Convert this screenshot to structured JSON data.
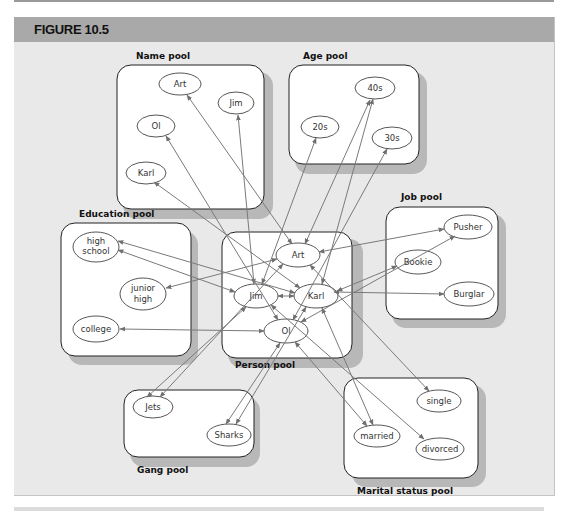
{
  "figure": {
    "title": "FIGURE 10.5",
    "colors": {
      "header": "#a9a9a9",
      "panel": "#e9e9e9",
      "pool_fill": "#ffffff",
      "pool_shadow": "#b9b9b9",
      "arrow": "#7a7a7a"
    }
  },
  "pools": {
    "name": {
      "label": "Name pool",
      "nodes": [
        "Art",
        "Jim",
        "Ol",
        "Karl"
      ]
    },
    "age": {
      "label": "Age pool",
      "nodes": [
        "40s",
        "20s",
        "30s"
      ]
    },
    "education": {
      "label": "Education pool",
      "nodes": [
        "high school",
        "junior high",
        "college"
      ]
    },
    "person": {
      "label": "Person pool",
      "nodes": [
        "Art",
        "Jim",
        "Karl",
        "Ol"
      ]
    },
    "job": {
      "label": "Job pool",
      "nodes": [
        "Pusher",
        "Bookie",
        "Burglar"
      ]
    },
    "gang": {
      "label": "Gang pool",
      "nodes": [
        "Jets",
        "Sharks"
      ]
    },
    "marital": {
      "label": "Marital status pool",
      "nodes": [
        "single",
        "married",
        "divorced"
      ]
    }
  },
  "labels": {
    "name_art": "Art",
    "name_jim": "Jim",
    "name_ol": "Ol",
    "name_karl": "Karl",
    "age_40s": "40s",
    "age_20s": "20s",
    "age_30s": "30s",
    "edu_high_1": "high",
    "edu_high_2": "school",
    "edu_junior_1": "junior",
    "edu_junior_2": "high",
    "edu_college": "college",
    "person_art": "Art",
    "person_jim": "Jim",
    "person_karl": "Karl",
    "person_ol": "Ol",
    "job_pusher": "Pusher",
    "job_bookie": "Bookie",
    "job_burglar": "Burglar",
    "gang_jets": "Jets",
    "gang_sharks": "Sharks",
    "marital_single": "single",
    "marital_married": "married",
    "marital_divorced": "divorced"
  },
  "connections": [
    {
      "from": "Art",
      "to": [
        "Art (name)",
        "40s",
        "junior high",
        "Pusher",
        "Jets",
        "single"
      ]
    },
    {
      "from": "Jim",
      "to": [
        "Jim (name)",
        "20s",
        "junior high",
        "Burglar",
        "Jets",
        "divorced"
      ]
    },
    {
      "from": "Karl",
      "to": [
        "Karl (name)",
        "40s",
        "high school",
        "Bookie",
        "Sharks",
        "married"
      ]
    },
    {
      "from": "Ol",
      "to": [
        "Ol (name)",
        "30s",
        "college",
        "Pusher",
        "Sharks",
        "married"
      ]
    }
  ]
}
